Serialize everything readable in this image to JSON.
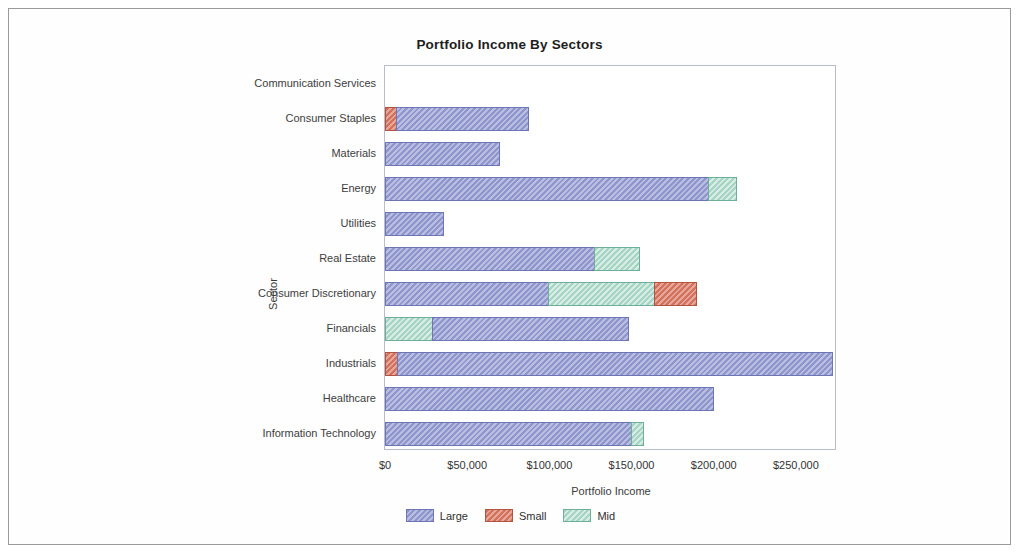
{
  "chart_data": {
    "type": "bar",
    "orientation": "horizontal",
    "stacked": true,
    "title": "Portfolio Income By Sectors",
    "xlabel": "Portfolio Income",
    "ylabel": "Sector",
    "xlim": [
      0,
      275000
    ],
    "xticks": [
      0,
      50000,
      100000,
      150000,
      200000,
      250000
    ],
    "xtick_labels": [
      "$0",
      "$50,000",
      "$100,000",
      "$150,000",
      "$200,000",
      "$250,000"
    ],
    "grid": false,
    "legend_position": "bottom",
    "categories": [
      "Communication Services",
      "Consumer Staples",
      "Materials",
      "Energy",
      "Utilities",
      "Real Estate",
      "Consumer Discretionary",
      "Financials",
      "Industrials",
      "Healthcare",
      "Information Technology"
    ],
    "series": [
      {
        "name": "Large",
        "color": "#8f96cd",
        "values": [
          0,
          81000,
          70000,
          197000,
          36000,
          128000,
          100000,
          120000,
          265000,
          200000,
          150000
        ]
      },
      {
        "name": "Small",
        "color": "#d4715c",
        "values": [
          0,
          7000,
          0,
          0,
          0,
          0,
          26000,
          0,
          8000,
          0,
          0
        ]
      },
      {
        "name": "Mid",
        "color": "#a6d5c4",
        "values": [
          0,
          0,
          0,
          18000,
          0,
          28000,
          65000,
          29000,
          0,
          0,
          8000
        ]
      }
    ],
    "bars": [
      {
        "category": "Communication Services",
        "segments": []
      },
      {
        "category": "Consumer Staples",
        "segments": [
          {
            "series": "Small",
            "value": 7000
          },
          {
            "series": "Large",
            "value": 81000
          }
        ]
      },
      {
        "category": "Materials",
        "segments": [
          {
            "series": "Large",
            "value": 70000
          }
        ]
      },
      {
        "category": "Energy",
        "segments": [
          {
            "series": "Large",
            "value": 197000
          },
          {
            "series": "Mid",
            "value": 18000
          }
        ]
      },
      {
        "category": "Utilities",
        "segments": [
          {
            "series": "Large",
            "value": 36000
          }
        ]
      },
      {
        "category": "Real Estate",
        "segments": [
          {
            "series": "Large",
            "value": 128000
          },
          {
            "series": "Mid",
            "value": 28000
          }
        ]
      },
      {
        "category": "Consumer Discretionary",
        "segments": [
          {
            "series": "Large",
            "value": 100000
          },
          {
            "series": "Mid",
            "value": 65000
          },
          {
            "series": "Small",
            "value": 26000
          }
        ]
      },
      {
        "category": "Financials",
        "segments": [
          {
            "series": "Mid",
            "value": 29000
          },
          {
            "series": "Large",
            "value": 120000
          }
        ]
      },
      {
        "category": "Industrials",
        "segments": [
          {
            "series": "Small",
            "value": 8000
          },
          {
            "series": "Large",
            "value": 265000
          }
        ]
      },
      {
        "category": "Healthcare",
        "segments": [
          {
            "series": "Large",
            "value": 200000
          }
        ]
      },
      {
        "category": "Information Technology",
        "segments": [
          {
            "series": "Large",
            "value": 150000
          },
          {
            "series": "Mid",
            "value": 8000
          }
        ]
      }
    ],
    "legend": [
      {
        "label": "Large",
        "color": "#8f96cd"
      },
      {
        "label": "Small",
        "color": "#d4715c"
      },
      {
        "label": "Mid",
        "color": "#a6d5c4"
      }
    ]
  }
}
